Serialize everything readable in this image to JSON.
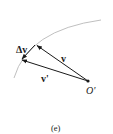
{
  "figure": {
    "caption": "(e)",
    "labels": {
      "delta_v": "Δv",
      "v": "v",
      "v_prime": "v'",
      "origin": "O'"
    },
    "colors": {
      "vector": "#1a1a1a",
      "arc": "#b8b8b8",
      "background": "#ffffff"
    }
  }
}
